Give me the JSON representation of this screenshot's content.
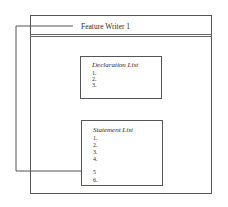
{
  "diagram": {
    "window_title": "Feature Writer 1",
    "declaration_list": {
      "title": "Declaration List",
      "items": [
        "1.",
        "2.",
        "3."
      ]
    },
    "statement_list": {
      "title": "Statement List",
      "items": [
        "1.",
        "2.",
        "3.",
        "4.",
        "5",
        "6."
      ],
      "highlighted_item": "5"
    },
    "colors": {
      "line": "#555555",
      "background": "#ffffff"
    }
  }
}
